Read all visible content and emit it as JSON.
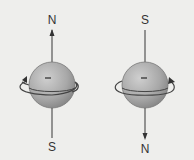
{
  "diagram": {
    "particles": [
      {
        "name": "spin-up",
        "charge_sign": "−",
        "top_label": "N",
        "bottom_label": "S",
        "axis_arrow": "up",
        "rotation": "counterclockwise"
      },
      {
        "name": "spin-down",
        "charge_sign": "−",
        "top_label": "S",
        "bottom_label": "N",
        "axis_arrow": "down",
        "rotation": "clockwise"
      }
    ],
    "colors": {
      "background": "#eeeeec",
      "sphere_light": "#c4c4c4",
      "sphere_dark": "#8a8a8a",
      "line": "#444444"
    }
  }
}
